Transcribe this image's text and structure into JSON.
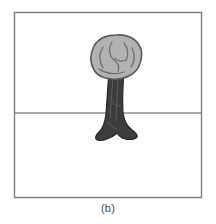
{
  "figure": {
    "caption": "(b)",
    "panel_label": "b",
    "type": "line-drawing-illustration"
  },
  "frame": {
    "x": 14,
    "y": 12,
    "width": 188,
    "height": 186,
    "stroke_color": "#7d7d7d",
    "stroke_width": 1.4,
    "fill_color": "#ffffff"
  },
  "horizon": {
    "label": "horizon-line",
    "y": 113,
    "x_start": 14,
    "x_end": 202,
    "stroke_color": "#8a8a8a",
    "stroke_width": 1.6
  },
  "tree": {
    "canopy": {
      "label": "tree-canopy",
      "fill_color": "#b2b2b2",
      "stroke_color": "#5a5a5a",
      "stroke_width": 1.6,
      "center_x": 116,
      "center_y": 57,
      "width": 50,
      "height": 44,
      "detail_stroke_color": "#6e6e6e",
      "detail_stroke_width": 1.3,
      "detail_count": 7
    },
    "trunk": {
      "label": "tree-trunk",
      "fill_color": "#3c3c3c",
      "stroke_color": "#262626",
      "stroke_width": 1.2,
      "top_y": 72,
      "base_y": 141,
      "top_width": 16,
      "base_width": 36,
      "bark_stroke_color": "#5d5d5d",
      "bark_stroke_width": 1.0,
      "bark_line_count": 4
    }
  },
  "palette": {
    "background": "#ffffff",
    "frame_gray": "#7d7d7d",
    "horizon_gray": "#8a8a8a",
    "canopy_gray": "#b2b2b2",
    "canopy_outline": "#5a5a5a",
    "trunk_dark": "#3c3c3c",
    "caption_gray": "#4a4a4a"
  }
}
